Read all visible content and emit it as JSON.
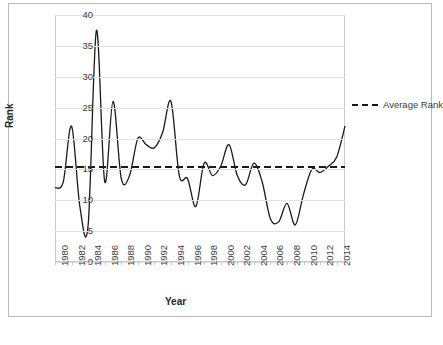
{
  "chart_data": {
    "type": "line",
    "title": "",
    "xlabel": "Year",
    "ylabel": "Rank",
    "xlim": [
      1980,
      2015
    ],
    "ylim": [
      0,
      40
    ],
    "grid": true,
    "legend_position": "right",
    "y_ticks": [
      0,
      5,
      10,
      15,
      20,
      25,
      30,
      35,
      40
    ],
    "x_ticks": [
      1980,
      1982,
      1984,
      1986,
      1988,
      1990,
      1992,
      1994,
      1996,
      1998,
      2000,
      2002,
      2004,
      2006,
      2008,
      2010,
      2012,
      2014
    ],
    "x": [
      1980,
      1981,
      1982,
      1983,
      1984,
      1985,
      1986,
      1987,
      1988,
      1989,
      1990,
      1991,
      1992,
      1993,
      1994,
      1995,
      1996,
      1997,
      1998,
      1999,
      2000,
      2001,
      2002,
      2003,
      2004,
      2005,
      2006,
      2007,
      2008,
      2009,
      2010,
      2011,
      2012,
      2013,
      2014,
      2015
    ],
    "series": [
      {
        "name": "Rank",
        "color": "#1a1a1a",
        "style": "solid",
        "values": [
          12,
          13,
          22,
          9,
          6,
          37.5,
          13,
          26,
          13.5,
          14,
          20,
          19,
          18.5,
          21,
          26,
          14,
          13.5,
          9,
          16,
          14,
          15.5,
          19,
          14,
          12.5,
          16,
          13,
          7,
          6.5,
          9.5,
          6,
          11,
          15,
          14.5,
          15.5,
          17,
          22
        ]
      },
      {
        "name": "Average Rank",
        "color": "#1a1a1a",
        "style": "dashed",
        "value": 15.4
      }
    ],
    "legend": [
      {
        "label": "Average Rank",
        "style": "dashed",
        "color": "#1a1a1a"
      }
    ]
  }
}
